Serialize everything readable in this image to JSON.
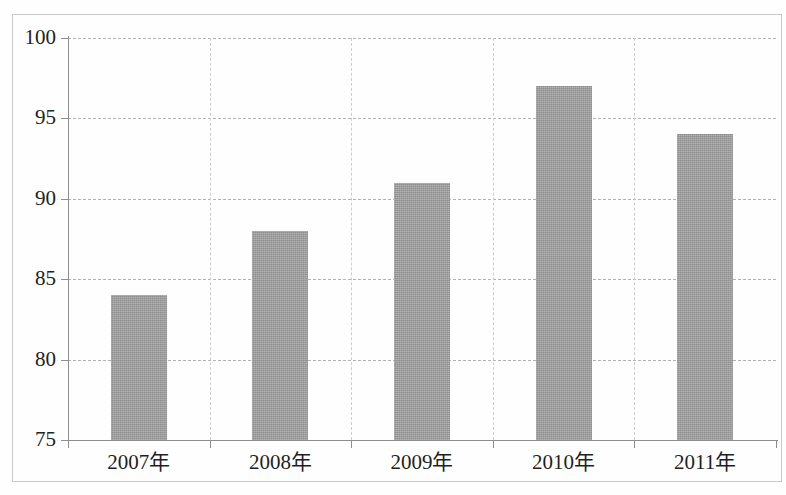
{
  "chart_data": {
    "type": "bar",
    "title": "",
    "subtitle": "",
    "xlabel": "",
    "ylabel": "",
    "categories": [
      "2007年",
      "2008年",
      "2009年",
      "2010年",
      "2011年"
    ],
    "values": [
      84,
      88,
      91,
      97,
      94
    ],
    "ylim": [
      75,
      100
    ],
    "ytick_labels": [
      "75",
      "80",
      "85",
      "90",
      "95",
      "100"
    ],
    "ytick_values": [
      75,
      80,
      85,
      90,
      95,
      100
    ],
    "grid": true,
    "grid_style": "dashed-horizontal",
    "legend": null,
    "legend_position": "none",
    "bar_color": "#9c9c9c",
    "grid_color": "#b4b4b4",
    "axis_color": "#8d8d8d",
    "background_color": "#ffffff",
    "series": [
      {
        "name": "",
        "values": [
          84,
          88,
          91,
          97,
          94
        ]
      }
    ]
  }
}
